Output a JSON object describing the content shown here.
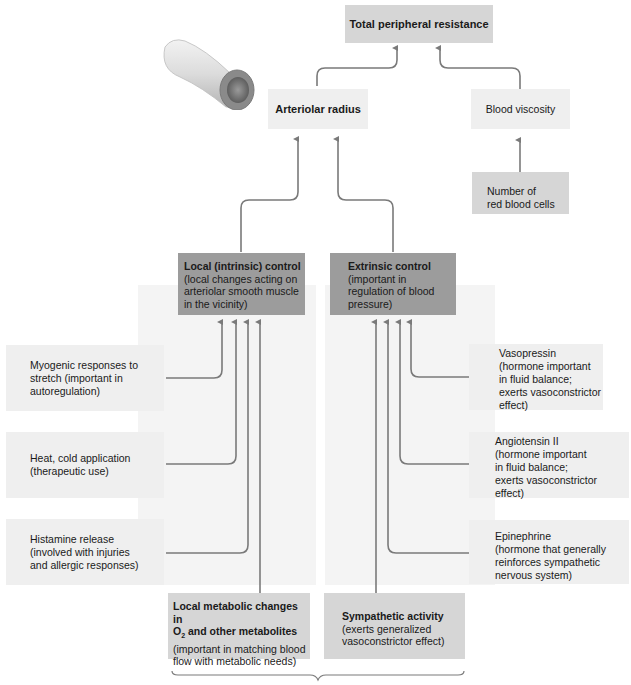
{
  "top": {
    "total_resistance": "Total peripheral resistance",
    "arteriolar_radius": "Arteriolar radius",
    "blood_viscosity": "Blood viscosity",
    "rbc": [
      "Number of",
      "red blood cells"
    ]
  },
  "local_control": {
    "title": "Local (intrinsic) control",
    "desc": [
      "(local changes acting on",
      "arteriolar smooth muscle",
      "in the vicinity)"
    ]
  },
  "extrinsic_control": {
    "title": "Extrinsic control",
    "desc": [
      "(important in",
      "regulation of blood",
      "pressure)"
    ]
  },
  "left_factors": [
    {
      "lines": [
        "Myogenic responses to",
        "stretch (important in",
        "autoregulation)"
      ]
    },
    {
      "lines": [
        "Heat, cold application",
        "(therapeutic use)"
      ]
    },
    {
      "lines": [
        "Histamine release",
        "(involved with injuries",
        "and allergic responses)"
      ]
    }
  ],
  "right_factors": [
    {
      "lines": [
        "Vasopressin",
        "(hormone important",
        "in fluid balance;",
        "exerts vasoconstrictor",
        "effect)"
      ]
    },
    {
      "lines": [
        "Angiotensin II",
        "(hormone important",
        "in fluid balance;",
        "exerts vasoconstrictor",
        "effect)"
      ]
    },
    {
      "lines": [
        "Epinephrine",
        "(hormone that generally",
        "reinforces sympathetic",
        "nervous system)"
      ]
    }
  ],
  "bottom": {
    "metabolic": {
      "title1": "Local metabolic changes in",
      "title2_pre": "O",
      "title2_sub": "2",
      "title2_post": " and other metabolites",
      "desc": [
        "(important in matching blood",
        "flow with metabolic needs)"
      ]
    },
    "sympathetic": {
      "title": "Sympathetic activity",
      "desc": [
        "(exerts generalized",
        "vasoconstrictor effect)"
      ]
    }
  },
  "colors": {
    "arrow": "#7a7a7a",
    "dark_box": "#9c9c9c",
    "mid_box": "#d6d6d6",
    "light_box": "#efefef"
  }
}
